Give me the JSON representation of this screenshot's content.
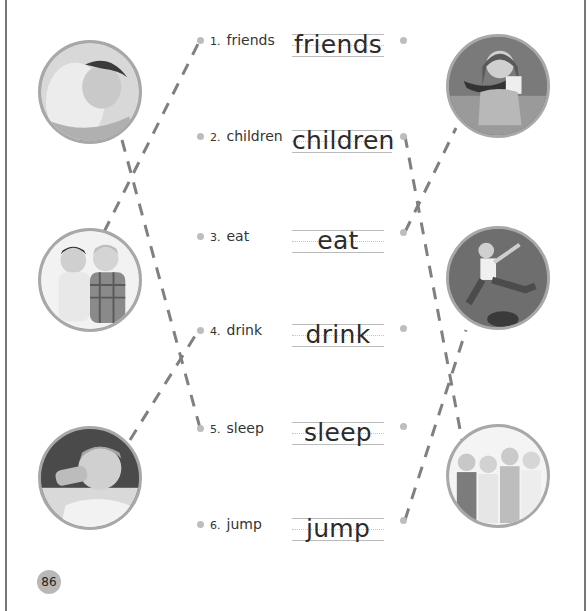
{
  "page": {
    "page_number": "86",
    "accent_line_color": "#808080",
    "dot_color": "#bdbdbd"
  },
  "left_photos": [
    {
      "id": "photo-sleeping-child",
      "depicts": "child sleeping"
    },
    {
      "id": "photo-two-friends",
      "depicts": "two children back to back"
    },
    {
      "id": "photo-drinking-boy",
      "depicts": "boy drinking from glass"
    }
  ],
  "right_photos": [
    {
      "id": "photo-eating-girl",
      "depicts": "girl eating watermelon"
    },
    {
      "id": "photo-jumping-boy",
      "depicts": "boy jumping"
    },
    {
      "id": "photo-group-children",
      "depicts": "four children standing"
    }
  ],
  "words": [
    {
      "number": "1.",
      "label": "friends",
      "trace": "friends"
    },
    {
      "number": "2.",
      "label": "children",
      "trace": "children"
    },
    {
      "number": "3.",
      "label": "eat",
      "trace": "eat"
    },
    {
      "number": "4.",
      "label": "drink",
      "trace": "drink"
    },
    {
      "number": "5.",
      "label": "sleep",
      "trace": "sleep"
    },
    {
      "number": "6.",
      "label": "jump",
      "trace": "jump"
    }
  ],
  "connections": [
    {
      "from": "photo-sleeping-child",
      "to": "5. sleep"
    },
    {
      "from": "photo-two-friends",
      "to": "1. friends"
    },
    {
      "from": "photo-drinking-boy",
      "to": "4. drink"
    },
    {
      "from": "eat",
      "to": "photo-eating-girl"
    },
    {
      "from": "jump",
      "to": "photo-jumping-boy"
    },
    {
      "from": "children",
      "to": "photo-group-children"
    }
  ]
}
